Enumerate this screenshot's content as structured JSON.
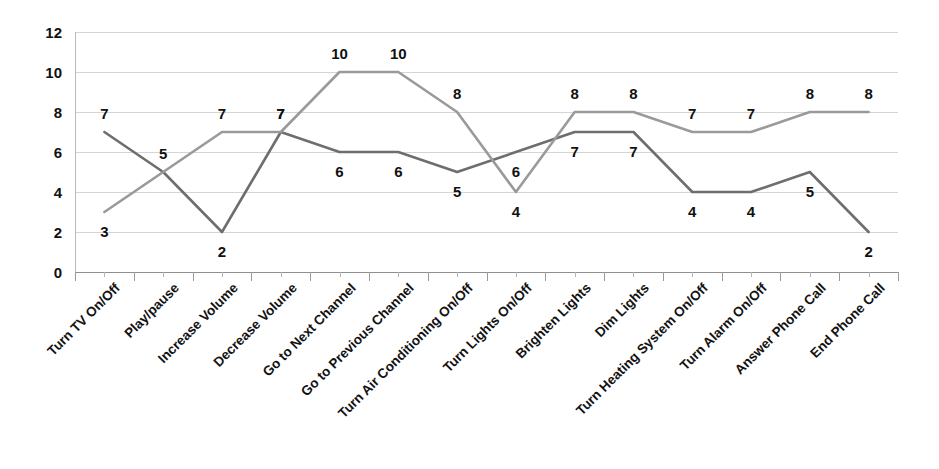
{
  "chart_data": {
    "type": "line",
    "title": "",
    "xlabel": "",
    "ylabel": "",
    "ylim": [
      0,
      12
    ],
    "yticks": [
      0,
      2,
      4,
      6,
      8,
      10,
      12
    ],
    "grid": true,
    "legend": "none",
    "categories": [
      "Turn TV On/Off",
      "Play/pause",
      "Increase Volume",
      "Decrease Volume",
      "Go to Next Channel",
      "Go to Previous Channel",
      "Turn Air Conditioning On/Off",
      "Turn Lights On/Off",
      "Brighten Lights",
      "Dim Lights",
      "Turn Heating System On/Off",
      "Turn Alarm On/Off",
      "Answer Phone Call",
      "End Phone Call"
    ],
    "series": [
      {
        "name": "Series 1",
        "color": "#6e6e6e",
        "values": [
          7,
          5,
          2,
          7,
          6,
          6,
          5,
          6,
          7,
          7,
          4,
          4,
          5,
          2
        ],
        "label_positions": [
          "above",
          "above",
          "below",
          "above",
          "below",
          "below",
          "below",
          "below",
          "below",
          "below",
          "below",
          "below",
          "below",
          "below"
        ]
      },
      {
        "name": "Series 2",
        "color": "#9a9a9a",
        "values": [
          3,
          5,
          7,
          7,
          10,
          10,
          8,
          4,
          8,
          8,
          7,
          7,
          8,
          8
        ],
        "label_positions": [
          "below",
          "above",
          "above",
          "above",
          "above",
          "above",
          "above",
          "below",
          "above",
          "above",
          "above",
          "above",
          "above",
          "above"
        ]
      }
    ],
    "point_labels": [
      {
        "category": "Turn TV On/Off",
        "series1": 7,
        "series2": 3
      },
      {
        "category": "Play/pause",
        "series1": 5,
        "series2": 5
      },
      {
        "category": "Increase Volume",
        "series1": 2,
        "series2": 7
      },
      {
        "category": "Decrease Volume",
        "series1": 7,
        "series2": 7
      },
      {
        "category": "Go to Next Channel",
        "series1": 6,
        "series2": 10
      },
      {
        "category": "Go to Previous Channel",
        "series1": 6,
        "series2": 10
      },
      {
        "category": "Turn Air Conditioning On/Off",
        "series1": 5,
        "series2": 8
      },
      {
        "category": "Turn Lights On/Off",
        "series1": 6,
        "series2": 4
      },
      {
        "category": "Brighten Lights",
        "series1": 7,
        "series2": 8
      },
      {
        "category": "Dim Lights",
        "series1": 7,
        "series2": 8
      },
      {
        "category": "Turn Heating System On/Off",
        "series1": 4,
        "series2": 7
      },
      {
        "category": "Turn Alarm On/Off",
        "series1": 4,
        "series2": 7
      },
      {
        "category": "Answer Phone Call",
        "series1": 5,
        "series2": 8
      },
      {
        "category": "End Phone Call",
        "series1": 2,
        "series2": 8
      }
    ]
  },
  "colors": {
    "background": "#ffffff",
    "gridline": "#d5d5d5",
    "axis": "#8f8f8f",
    "text": "#111111",
    "series1": "#6e6e6e",
    "series2": "#9a9a9a"
  }
}
